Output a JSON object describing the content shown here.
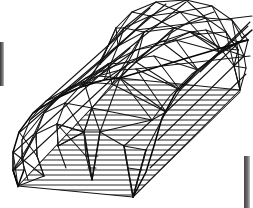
{
  "figure": {
    "projection": "axonometric",
    "line_color": "#141414",
    "background_color": "#ffffff",
    "hatch_color": "#1c1c1c",
    "scan_artifact_color": "#3a3a3a"
  },
  "geometry": {
    "canvas": {
      "width": 253,
      "height": 208
    },
    "floor": {
      "label": "hatched-floor-plane",
      "corners": [
        [
          18,
          186
        ],
        [
          133,
          197
        ],
        [
          240,
          90
        ],
        [
          120,
          78
        ]
      ],
      "hatch_spacing": 5.2,
      "hatch_count": 21
    },
    "arches": [
      {
        "name": "arch-near-left",
        "springing_left": [
          18,
          186
        ],
        "springing_right": [
          120,
          78
        ],
        "points": [
          [
            18,
            186
          ],
          [
            14,
            168
          ],
          [
            14,
            150
          ],
          [
            20,
            130
          ],
          [
            34,
            112
          ],
          [
            56,
            98
          ],
          [
            82,
            86
          ],
          [
            105,
            79
          ],
          [
            120,
            78
          ]
        ]
      },
      {
        "name": "arch-mid-1",
        "points": [
          [
            40,
            182
          ],
          [
            34,
            162
          ],
          [
            34,
            142
          ],
          [
            42,
            122
          ],
          [
            58,
            104
          ],
          [
            80,
            90
          ],
          [
            106,
            80
          ],
          [
            128,
            74
          ],
          [
            144,
            73
          ]
        ]
      },
      {
        "name": "arch-mid-2",
        "points": [
          [
            78,
            160
          ],
          [
            72,
            140
          ],
          [
            72,
            120
          ],
          [
            80,
            100
          ],
          [
            96,
            82
          ],
          [
            118,
            68
          ],
          [
            144,
            58
          ],
          [
            166,
            52
          ],
          [
            182,
            51
          ]
        ]
      },
      {
        "name": "arch-far-right",
        "springing_left": [
          133,
          197
        ],
        "springing_right": [
          240,
          90
        ],
        "points": [
          [
            133,
            197
          ],
          [
            150,
            168
          ],
          [
            158,
            140
          ],
          [
            166,
            112
          ],
          [
            180,
            90
          ],
          [
            200,
            72
          ],
          [
            218,
            60
          ],
          [
            232,
            56
          ],
          [
            240,
            58
          ]
        ]
      }
    ],
    "ridge": {
      "name": "ridge-line",
      "from": [
        120,
        78
      ],
      "to": [
        240,
        62
      ]
    },
    "node_count": 64,
    "member_count": 182
  },
  "scan_artifacts": [
    {
      "name": "left-edge-bar",
      "x": 0,
      "y": 42,
      "width": 4,
      "height": 44,
      "color": "#3a3a3a"
    },
    {
      "name": "bottom-right-bar",
      "x": 244,
      "y": 156,
      "width": 6,
      "height": 52,
      "color": "#454545"
    }
  ],
  "labels": {
    "caption": "",
    "annotations": []
  }
}
